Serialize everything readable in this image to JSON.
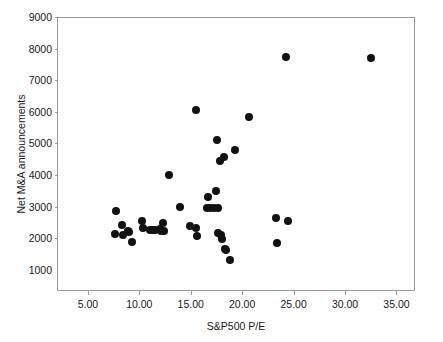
{
  "chart_data": {
    "type": "scatter",
    "title": "",
    "xlabel": "S&P500 P/E",
    "ylabel": "Net M&A announcements",
    "xlim": [
      2.0,
      36.8
    ],
    "ylim": [
      325,
      9000
    ],
    "grid": false,
    "legend": null,
    "xticks": [
      "5.00",
      "10.00",
      "15.00",
      "20.00",
      "25.00",
      "30.00",
      "35.00"
    ],
    "xtick_values": [
      5,
      10,
      15,
      20,
      25,
      30,
      35
    ],
    "yticks": [
      "1000",
      "2000",
      "3000",
      "4000",
      "5000",
      "6000",
      "7000",
      "8000",
      "9000"
    ],
    "ytick_values": [
      1000,
      2000,
      3000,
      4000,
      5000,
      6000,
      7000,
      8000,
      9000
    ],
    "marker": "filled-circle",
    "marker_color": "#111111",
    "marker_size_px": 8,
    "n_points": 44,
    "points": [
      {
        "x": 7.6,
        "y": 2900
      },
      {
        "x": 7.5,
        "y": 2150
      },
      {
        "x": 8.2,
        "y": 2450
      },
      {
        "x": 8.3,
        "y": 2130
      },
      {
        "x": 8.8,
        "y": 2270
      },
      {
        "x": 8.9,
        "y": 2210
      },
      {
        "x": 9.2,
        "y": 1900
      },
      {
        "x": 10.2,
        "y": 2560
      },
      {
        "x": 10.3,
        "y": 2350
      },
      {
        "x": 10.9,
        "y": 2300
      },
      {
        "x": 11.4,
        "y": 2300
      },
      {
        "x": 11.9,
        "y": 2320
      },
      {
        "x": 12.2,
        "y": 2500
      },
      {
        "x": 12.3,
        "y": 2270
      },
      {
        "x": 12.8,
        "y": 4030
      },
      {
        "x": 13.9,
        "y": 3010
      },
      {
        "x": 14.8,
        "y": 2400
      },
      {
        "x": 15.4,
        "y": 6100
      },
      {
        "x": 15.4,
        "y": 2340
      },
      {
        "x": 15.5,
        "y": 2090
      },
      {
        "x": 16.6,
        "y": 3340
      },
      {
        "x": 16.8,
        "y": 3000
      },
      {
        "x": 17.4,
        "y": 3520
      },
      {
        "x": 17.5,
        "y": 5150
      },
      {
        "x": 17.6,
        "y": 2990
      },
      {
        "x": 17.6,
        "y": 2200
      },
      {
        "x": 17.7,
        "y": 4460
      },
      {
        "x": 17.8,
        "y": 2120
      },
      {
        "x": 17.9,
        "y": 2000
      },
      {
        "x": 18.1,
        "y": 4600
      },
      {
        "x": 18.2,
        "y": 1700
      },
      {
        "x": 18.3,
        "y": 1650
      },
      {
        "x": 18.7,
        "y": 1340
      },
      {
        "x": 19.2,
        "y": 4830
      },
      {
        "x": 20.6,
        "y": 5850
      },
      {
        "x": 23.2,
        "y": 2670
      },
      {
        "x": 23.3,
        "y": 1880
      },
      {
        "x": 24.2,
        "y": 7760
      },
      {
        "x": 24.4,
        "y": 2580
      },
      {
        "x": 32.4,
        "y": 7730
      },
      {
        "x": 16.5,
        "y": 2990
      },
      {
        "x": 17.2,
        "y": 2980
      },
      {
        "x": 11.2,
        "y": 2290
      },
      {
        "x": 12.0,
        "y": 2270
      }
    ]
  },
  "topmark": {
    "text": ""
  }
}
